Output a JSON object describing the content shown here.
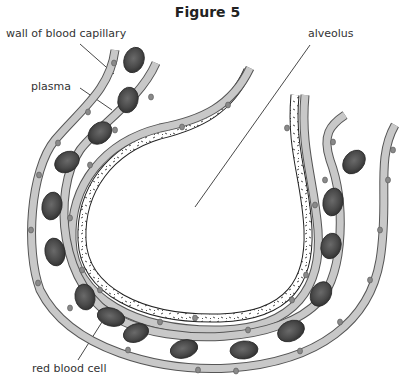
{
  "figure": {
    "title": "Figure 5",
    "labels": {
      "capillary_wall": "wall of blood capillary",
      "plasma": "plasma",
      "alveolus": "alveolus",
      "red_blood_cell": "red blood cell"
    }
  },
  "colors": {
    "cell_fill": "#c8c8c8",
    "cell_stroke": "#555555",
    "nucleus": "#8a8a8a",
    "rbc_fill": "#4a4a4a",
    "rbc_dark": "#2e2e2e",
    "leader_line": "#333333",
    "background": "#ffffff"
  }
}
